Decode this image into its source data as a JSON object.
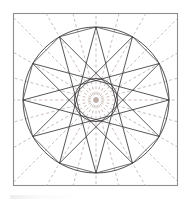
{
  "figure": {
    "background_color": "#ffffff",
    "frame": {
      "stroke_color": "#8d8d8d",
      "x": 13.5,
      "y": 13.5,
      "width": 164,
      "height": 172
    },
    "center": {
      "x": 96,
      "y": 100
    },
    "outer_circle": {
      "radius": 73,
      "stroke_color": "#3a3a3a"
    },
    "inner_circle": {
      "radius": 21.5,
      "stroke_color": "#3a3a3a"
    },
    "dodecagon": {
      "sides": 12,
      "radius": 73,
      "stroke_color": "#4a4a4a"
    },
    "star": {
      "points": 12,
      "skip": 5,
      "outer_radius": 73,
      "stroke_color": "#3a3a3a"
    },
    "construction_rays": {
      "count": 24,
      "inner_radius": 0,
      "outer_extent": 150,
      "stroke_color": "#b9a9a3",
      "dash_pattern": "3 2.4"
    }
  },
  "chart_data": {
    "type": "scatter",
    "xlabel": "",
    "ylabel": "",
    "grid": false,
    "legend": "none",
    "xlim": [
      13.5,
      177.5
    ],
    "ylim": [
      13.5,
      185.5
    ],
    "series": [
      {
        "name": "star-vertices-outer",
        "values": [
          [
            169.0,
            100.0
          ],
          [
            159.2,
            136.5
          ],
          [
            132.5,
            163.2
          ],
          [
            96.0,
            173.0
          ],
          [
            59.5,
            163.2
          ],
          [
            32.8,
            136.5
          ],
          [
            23.0,
            100.0
          ],
          [
            32.8,
            63.5
          ],
          [
            59.5,
            36.8
          ],
          [
            96.0,
            27.0
          ],
          [
            132.5,
            36.8
          ],
          [
            159.2,
            63.5
          ]
        ]
      },
      {
        "name": "inner-circle-radius",
        "values": [
          [
            21.5
          ]
        ]
      }
    ]
  }
}
